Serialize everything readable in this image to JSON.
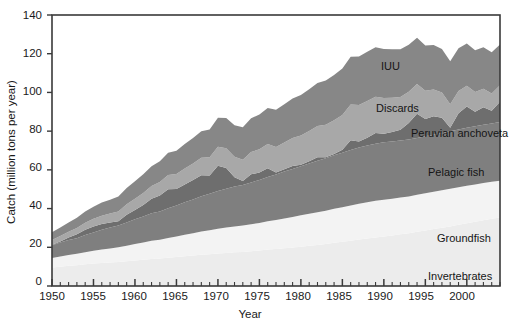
{
  "chart_data": {
    "type": "area",
    "stacked": true,
    "title": "",
    "xlabel": "Year",
    "ylabel": "Catch (million tons per year)",
    "xlim": [
      1950,
      2004
    ],
    "ylim": [
      0,
      140
    ],
    "grid": false,
    "legend_position": "inline-labels",
    "y_ticks": [
      0,
      20,
      40,
      60,
      80,
      100,
      120,
      140
    ],
    "y_tick_labels": [
      "0",
      "20",
      "40",
      "60",
      "80",
      "100",
      "120",
      "140"
    ],
    "x_ticks": [
      1950,
      1955,
      1960,
      1965,
      1970,
      1975,
      1980,
      1985,
      1990,
      1995,
      2000
    ],
    "x_tick_labels": [
      "1950",
      "1955",
      "1960",
      "1965",
      "1970",
      "1975",
      "1980",
      "1985",
      "1990",
      "1995",
      "2000"
    ],
    "x_minor_tick_interval": 1,
    "x": [
      1950,
      1951,
      1952,
      1953,
      1954,
      1955,
      1956,
      1957,
      1958,
      1959,
      1960,
      1961,
      1962,
      1963,
      1964,
      1965,
      1966,
      1967,
      1968,
      1969,
      1970,
      1971,
      1972,
      1973,
      1974,
      1975,
      1976,
      1977,
      1978,
      1979,
      1980,
      1981,
      1982,
      1983,
      1984,
      1985,
      1986,
      1987,
      1988,
      1989,
      1990,
      1991,
      1992,
      1993,
      1994,
      1995,
      1996,
      1997,
      1998,
      1999,
      2000,
      2001,
      2002,
      2003,
      2004
    ],
    "series": [
      {
        "name": "Invertebrates",
        "color": "#ececec",
        "label_x": 1996.5,
        "label_y": 13,
        "values": [
          9.5,
          10.0,
          10.4,
          10.7,
          11.2,
          11.6,
          11.9,
          12.1,
          12.4,
          12.8,
          13.2,
          13.6,
          14.0,
          14.2,
          14.6,
          15.0,
          15.4,
          15.8,
          16.2,
          16.4,
          16.8,
          17.1,
          17.4,
          17.6,
          18.0,
          18.4,
          18.8,
          19.1,
          19.5,
          19.9,
          20.3,
          20.8,
          21.2,
          21.7,
          22.3,
          22.8,
          23.4,
          24.0,
          24.6,
          25.1,
          25.6,
          26.1,
          26.7,
          27.3,
          28.0,
          28.7,
          29.4,
          30.1,
          30.8,
          31.6,
          32.4,
          33.2,
          34.0,
          34.7,
          35.4
        ]
      },
      {
        "name": "Groundfish",
        "color": "#f3f3f3",
        "label_x": 1997.0,
        "label_y": 30,
        "values": [
          5.0,
          5.3,
          5.6,
          5.9,
          6.3,
          6.6,
          7.0,
          7.3,
          7.6,
          8.0,
          8.5,
          8.9,
          9.4,
          9.7,
          10.2,
          10.6,
          11.1,
          11.5,
          12.0,
          12.4,
          12.8,
          13.1,
          13.4,
          13.6,
          13.9,
          14.2,
          14.6,
          15.0,
          15.4,
          15.8,
          16.2,
          16.5,
          16.9,
          17.2,
          17.6,
          17.9,
          18.2,
          18.5,
          18.7,
          18.9,
          19.0,
          19.0,
          19.0,
          19.0,
          19.1,
          19.2,
          19.3,
          19.4,
          19.4,
          19.4,
          19.4,
          19.3,
          19.2,
          19.1,
          19.0
        ]
      },
      {
        "name": "Pelagic fish",
        "color": "#7f7f7f",
        "label_x": 1995.5,
        "label_y": 63,
        "values": [
          6.5,
          7.2,
          7.8,
          8.1,
          8.8,
          9.4,
          10.1,
          10.8,
          11.3,
          12.0,
          12.8,
          13.4,
          14.2,
          14.6,
          15.4,
          16.0,
          16.8,
          17.4,
          18.2,
          18.8,
          19.5,
          20.0,
          20.6,
          21.0,
          21.6,
          22.2,
          22.9,
          23.5,
          24.2,
          24.8,
          25.4,
          26.0,
          26.6,
          27.1,
          27.7,
          28.2,
          28.7,
          29.0,
          29.3,
          29.5,
          29.6,
          29.6,
          29.5,
          29.4,
          29.4,
          29.4,
          29.5,
          29.6,
          29.7,
          29.8,
          29.9,
          30.0,
          30.1,
          30.2,
          30.3
        ]
      },
      {
        "name": "Peruvian anchoveta",
        "color": "#6e6e6e",
        "label_x": 1997.0,
        "label_y": 84,
        "values": [
          0.3,
          0.5,
          1.2,
          2.0,
          2.8,
          3.2,
          3.0,
          2.6,
          2.2,
          4.0,
          4.8,
          6.0,
          7.5,
          8.2,
          9.8,
          8.5,
          9.2,
          10.0,
          10.8,
          9.5,
          13.0,
          10.8,
          4.8,
          2.0,
          4.2,
          3.8,
          4.5,
          1.0,
          1.2,
          1.5,
          0.8,
          1.2,
          1.8,
          0.5,
          0.6,
          1.5,
          5.0,
          3.2,
          4.0,
          5.5,
          4.5,
          4.8,
          5.5,
          8.5,
          12.5,
          9.0,
          9.5,
          7.8,
          1.8,
          8.5,
          11.0,
          7.5,
          9.0,
          6.5,
          10.5
        ]
      },
      {
        "name": "Discards",
        "color": "#a8a8a8",
        "label_x": 1984.5,
        "label_y": 97,
        "values": [
          2.5,
          2.8,
          3.0,
          3.3,
          3.6,
          4.0,
          4.3,
          4.6,
          5.0,
          5.4,
          5.8,
          6.2,
          6.6,
          7.0,
          7.4,
          7.8,
          8.2,
          8.6,
          9.0,
          9.4,
          9.8,
          10.2,
          10.6,
          11.0,
          11.5,
          12.0,
          12.6,
          13.2,
          13.8,
          14.4,
          15.0,
          15.6,
          16.2,
          16.8,
          17.4,
          18.0,
          18.5,
          18.8,
          19.0,
          18.8,
          18.4,
          17.8,
          17.0,
          16.2,
          15.4,
          14.6,
          13.8,
          13.0,
          12.2,
          11.5,
          10.8,
          10.2,
          9.6,
          9.0,
          8.5
        ]
      },
      {
        "name": "IUU",
        "color": "#878787",
        "label_x": 1985.0,
        "label_y": 116,
        "values": [
          4.0,
          4.4,
          4.8,
          5.2,
          5.8,
          6.2,
          6.8,
          7.2,
          7.8,
          8.4,
          9.0,
          9.6,
          10.2,
          10.8,
          11.4,
          12.0,
          12.6,
          13.2,
          13.8,
          14.4,
          15.0,
          15.6,
          16.2,
          16.8,
          17.4,
          18.0,
          18.6,
          19.2,
          19.8,
          20.4,
          21.0,
          21.6,
          22.2,
          22.8,
          23.4,
          24.0,
          24.6,
          25.0,
          25.4,
          25.6,
          25.4,
          25.0,
          24.6,
          24.2,
          23.8,
          23.4,
          23.0,
          22.6,
          22.2,
          22.0,
          21.8,
          21.6,
          21.4,
          21.2,
          21.0
        ]
      }
    ]
  },
  "labels": {
    "iuu": "IUU",
    "discards": "Discards",
    "peruvian_anchoveta": "Peruvian anchoveta",
    "pelagic_fish": "Pelagic fish",
    "groundfish": "Groundfish",
    "invertebrates": "Invertebrates",
    "x_axis_title": "Year",
    "y_axis_title": "Catch (million tons per year)",
    "y0": "0",
    "y20": "20",
    "y40": "40",
    "y60": "60",
    "y80": "80",
    "y100": "100",
    "y120": "120",
    "y140": "140",
    "x1950": "1950",
    "x1955": "1955",
    "x1960": "1960",
    "x1965": "1965",
    "x1970": "1970",
    "x1975": "1975",
    "x1980": "1980",
    "x1985": "1985",
    "x1990": "1990",
    "x1995": "1995",
    "x2000": "2000"
  },
  "colors": {
    "invertebrates": "#ececec",
    "groundfish": "#f3f3f3",
    "pelagic_fish": "#7f7f7f",
    "peruvian_anchoveta": "#6e6e6e",
    "discards": "#a8a8a8",
    "iuu": "#878787",
    "axis": "#3a3a3a",
    "text": "#151515",
    "background": "#ffffff"
  }
}
